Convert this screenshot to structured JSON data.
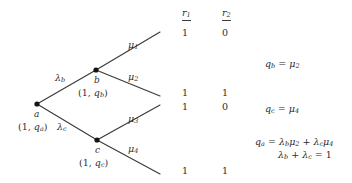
{
  "figure": {
    "type": "probability-tree-diagram",
    "background_color": "#ffffff",
    "line_color": "#3a3a3a",
    "node_color": "#1a1a1a"
  },
  "tree": {
    "nodes": [
      {
        "id": "a",
        "name": "a",
        "pair": "(1, qₐ)",
        "x": 37,
        "y": 104
      },
      {
        "id": "b",
        "name": "b",
        "pair": "(1, qʙ)",
        "x": 96,
        "y": 70
      },
      {
        "id": "c",
        "name": "c",
        "pair": "(1, qꜱ)",
        "x": 97,
        "y": 140
      }
    ],
    "node_labels": {
      "a_name": "a",
      "a_pair_open": "(1, ",
      "a_pair_q": "q",
      "a_pair_sub": "a",
      "a_pair_close": ")",
      "b_name": "b",
      "b_pair_open": "(1, ",
      "b_pair_q": "q",
      "b_pair_sub": "b",
      "b_pair_close": ")",
      "c_name": "c",
      "c_pair_open": "(1, ",
      "c_pair_q": "q",
      "c_pair_sub": "c",
      "c_pair_close": ")"
    },
    "edge_labels": {
      "lambda_b_sym": "λ",
      "lambda_b_sub": "b",
      "lambda_c_sym": "λ",
      "lambda_c_sub": "c"
    },
    "branch_labels": {
      "mu1_sym": "μ",
      "mu1_sub": "1",
      "mu2_sym": "μ",
      "mu2_sub": "2",
      "mu3_sym": "μ",
      "mu3_sub": "3",
      "mu4_sym": "μ",
      "mu4_sub": "4"
    }
  },
  "table": {
    "headers": [
      {
        "sym": "r",
        "sub": "1"
      },
      {
        "sym": "r",
        "sub": "2"
      }
    ],
    "rows": [
      {
        "r1": "1",
        "r2": "0"
      },
      {
        "r1": "1",
        "r2": "1"
      },
      {
        "r1": "1",
        "r2": "0"
      },
      {
        "r1": "1",
        "r2": "1"
      }
    ]
  },
  "equations": {
    "qb": {
      "lhs_q": "q",
      "lhs_sub": "b",
      "eq": " = ",
      "rhs_sym": "μ",
      "rhs_sub": "2"
    },
    "qc": {
      "lhs_q": "q",
      "lhs_sub": "c",
      "eq": " = ",
      "rhs_sym": "μ",
      "rhs_sub": "4"
    },
    "qa": {
      "lhs_q": "q",
      "lhs_sub": "a",
      "eq": " = ",
      "t1_lam": "λ",
      "t1_lam_sub": "b",
      "t1_mu": "μ",
      "t1_mu_sub": "2",
      "plus": " + ",
      "t2_lam": "λ",
      "t2_lam_sub": "c",
      "t2_mu": "μ",
      "t2_mu_sub": "4"
    },
    "lambda_sum": {
      "l1": "λ",
      "l1_sub": "b",
      "plus": " + ",
      "l2": "λ",
      "l2_sub": "c",
      "eq": " = ",
      "value": "1"
    }
  }
}
